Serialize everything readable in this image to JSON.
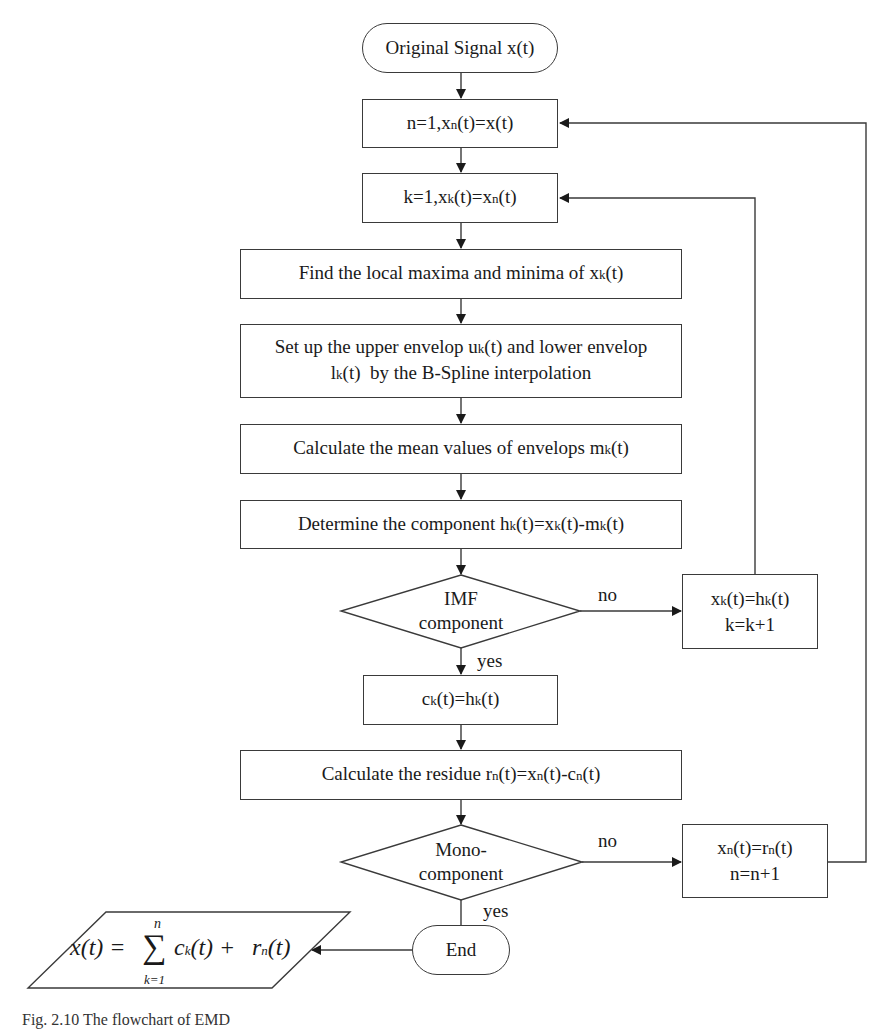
{
  "flowchart": {
    "start": "Original Signal x(t)",
    "init_n": {
      "pre": "n=1,x",
      "sub": "n",
      "post": "(t)=x(t)"
    },
    "init_k": {
      "pre": "k=1,x",
      "sub1": "k",
      "mid": "(t)=x",
      "sub2": "n",
      "post": "(t)"
    },
    "find_extrema": {
      "pre": "Find the local maxima and minima of x",
      "sub": "k",
      "post": "(t)"
    },
    "envelopes": {
      "line1_pre": "Set up the upper envelop u",
      "line1_sub": "k",
      "line1_post": "(t) and lower envelop",
      "line2_pre": "l",
      "line2_sub": "k",
      "line2_post": "(t)  by the B-Spline interpolation"
    },
    "mean": {
      "pre": "Calculate the mean values of envelops m",
      "sub": "k",
      "post": "(t)"
    },
    "component": {
      "pre": "Determine the component h",
      "sub1": "k",
      "mid1": "(t)=x",
      "sub2": "k",
      "mid2": "(t)-m",
      "sub3": "k",
      "post": "(t)"
    },
    "imf_decision": {
      "line1": "IMF",
      "line2": "component",
      "no_label": "no",
      "yes_label": "yes"
    },
    "update_k": {
      "line1_pre": "x",
      "line1_sub1": "k",
      "line1_mid": "(t)=h",
      "line1_sub2": "k",
      "line1_post": "(t)",
      "line2": "k=k+1"
    },
    "assign_c": {
      "pre": "c",
      "sub1": "k",
      "mid": "(t)=h",
      "sub2": "k",
      "post": "(t)"
    },
    "residue": {
      "pre": "Calculate the residue r",
      "sub1": "n",
      "mid1": "(t)=x",
      "sub2": "n",
      "mid2": "(t)-c",
      "sub3": "n",
      "post": "(t)"
    },
    "mono_decision": {
      "line1": "Mono-",
      "line2": "component",
      "no_label": "no",
      "yes_label": "yes"
    },
    "update_n": {
      "line1_pre": "x",
      "line1_sub1": "n",
      "line1_mid": "(t)=r",
      "line1_sub2": "n",
      "line1_post": "(t)",
      "line2": "n=n+1"
    },
    "end": "End",
    "output_formula": {
      "lhs": "x(t) = ",
      "sum_symbol": "∑",
      "sum_upper": "n",
      "sum_lower": "k=1",
      "term1": "c",
      "term1_sub": "k",
      "term1_arg": "(t) +",
      "term2": "r",
      "term2_sub": "n",
      "term2_arg": "(t)"
    }
  },
  "caption": "Fig. 2.10  The flowchart of EMD",
  "colors": {
    "line": "#3a3a3a",
    "background": "#ffffff"
  }
}
